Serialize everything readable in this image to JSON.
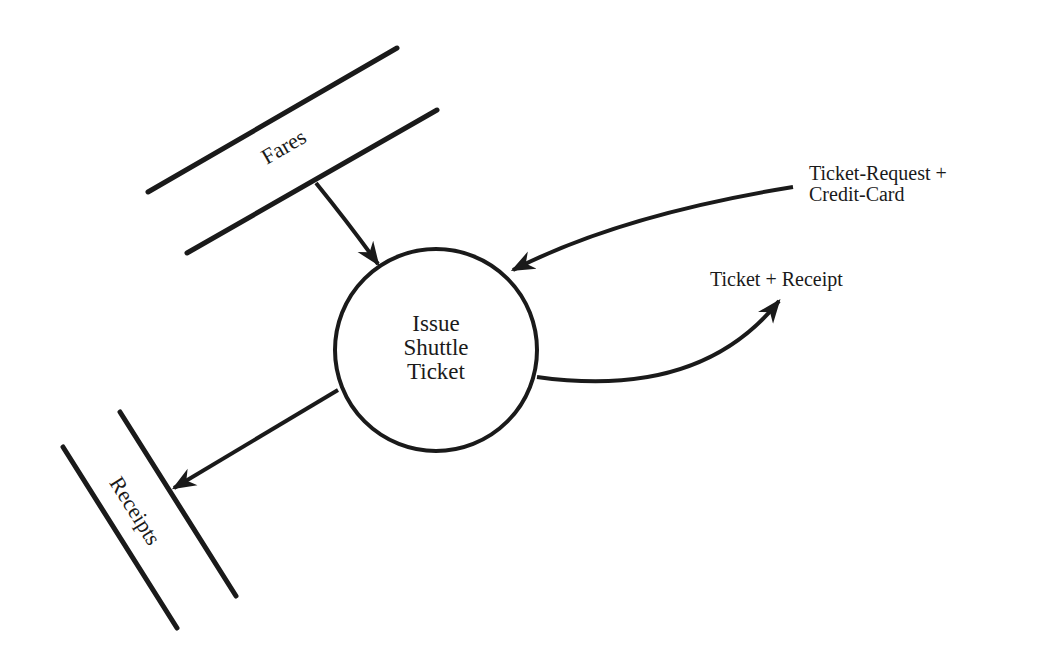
{
  "diagram": {
    "type": "data-flow-diagram",
    "process": {
      "label_lines": [
        "Issue",
        "Shuttle",
        "Ticket"
      ]
    },
    "data_stores": [
      {
        "id": "fares",
        "label": "Fares"
      },
      {
        "id": "receipts",
        "label": "Receipts"
      }
    ],
    "flows": [
      {
        "id": "fares-to-process",
        "from": "Fares",
        "to": "Issue Shuttle Ticket",
        "label": ""
      },
      {
        "id": "request-in",
        "from": "external",
        "to": "Issue Shuttle Ticket",
        "label_lines": [
          "Ticket-Request +",
          "Credit-Card"
        ]
      },
      {
        "id": "ticket-out",
        "from": "Issue Shuttle Ticket",
        "to": "external",
        "label": "Ticket + Receipt"
      },
      {
        "id": "process-to-receipts",
        "from": "Issue Shuttle Ticket",
        "to": "Receipts",
        "label": ""
      }
    ],
    "colors": {
      "stroke": "#1a1a1a",
      "background": "#ffffff"
    }
  }
}
